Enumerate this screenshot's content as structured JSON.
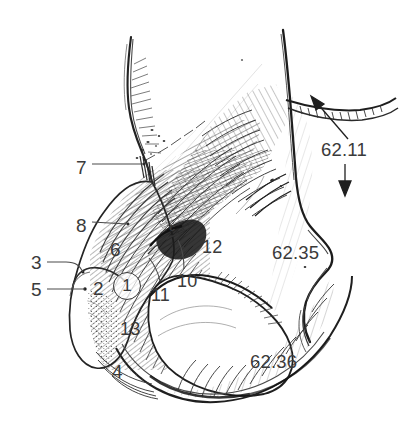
{
  "figure": {
    "type": "anatomical-line-drawing",
    "style": "pen-and-ink cross-hatching",
    "background_color": "#ffffff",
    "ink_color": "#2b2b2b",
    "label_color": "#3a3a3a"
  },
  "labels": [
    {
      "id": "lbl-7",
      "text": "7",
      "x": 76,
      "y": 158,
      "leader": "horizontal-right"
    },
    {
      "id": "lbl-8",
      "text": "8",
      "x": 76,
      "y": 216,
      "leader": "horizontal-right"
    },
    {
      "id": "lbl-6",
      "text": "6",
      "x": 110,
      "y": 240,
      "leader": "none"
    },
    {
      "id": "lbl-3",
      "text": "3",
      "x": 31,
      "y": 258,
      "leader": "diagonal-down-right"
    },
    {
      "id": "lbl-5",
      "text": "5",
      "x": 31,
      "y": 283,
      "leader": "horizontal-right"
    },
    {
      "id": "lbl-2",
      "text": "2",
      "x": 93,
      "y": 281,
      "leader": "none"
    },
    {
      "id": "lbl-1",
      "text": "1",
      "x": 113,
      "y": 272,
      "leader": "none",
      "circled": true
    },
    {
      "id": "lbl-11",
      "text": "11",
      "x": 151,
      "y": 286,
      "leader": "up-left-stub"
    },
    {
      "id": "lbl-10",
      "text": "10",
      "x": 177,
      "y": 274,
      "leader": "up-left-stub"
    },
    {
      "id": "lbl-12",
      "text": "12",
      "x": 202,
      "y": 241,
      "leader": "none"
    },
    {
      "id": "lbl-13",
      "text": "13",
      "x": 120,
      "y": 323,
      "leader": "none"
    },
    {
      "id": "lbl-4",
      "text": "4",
      "x": 112,
      "y": 365,
      "leader": "none"
    },
    {
      "id": "lbl-62-11",
      "text": "62.11",
      "x": 321,
      "y": 143,
      "leader": "two-arrows"
    },
    {
      "id": "lbl-62-35",
      "text": "62.35",
      "x": 272,
      "y": 246,
      "leader": "none"
    },
    {
      "id": "lbl-62-36",
      "text": "62.36",
      "x": 250,
      "y": 355,
      "leader": "none"
    }
  ],
  "markers": [
    {
      "id": "marker-c",
      "text": "c",
      "x": 171,
      "y": 228
    }
  ],
  "arrows": [
    {
      "id": "arrow-62-11-upper",
      "direction": "up-right",
      "from_x": 348,
      "from_y": 140,
      "to_x": 312,
      "to_y": 98
    },
    {
      "id": "arrow-62-11-lower",
      "direction": "down",
      "from_x": 345,
      "from_y": 165,
      "to_x": 345,
      "to_y": 195
    }
  ]
}
